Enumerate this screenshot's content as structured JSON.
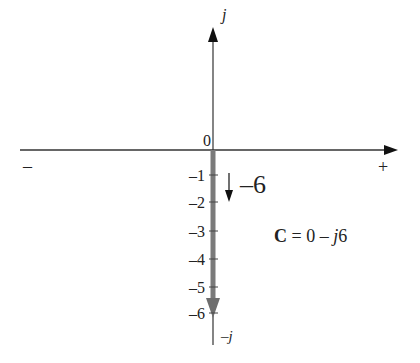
{
  "diagram": {
    "type": "complex-plane",
    "axes": {
      "horizontal": {
        "negative_label": "–",
        "positive_label": "+"
      },
      "vertical": {
        "positive_label": "j",
        "negative_label": "–j"
      },
      "origin_label": "0"
    },
    "ticks": [
      {
        "value": -1,
        "label": "–1"
      },
      {
        "value": -2,
        "label": "–2"
      },
      {
        "value": -3,
        "label": "–3"
      },
      {
        "value": -4,
        "label": "–4"
      },
      {
        "value": -5,
        "label": "–5"
      },
      {
        "value": -6,
        "label": "–6"
      }
    ],
    "phasor": {
      "real": 0,
      "imag": -6,
      "color": "#7a7a7a"
    },
    "annotation_value": "–6",
    "equation": {
      "name": "C",
      "eq": " = 0 – ",
      "j": "j",
      "num": "6"
    }
  }
}
